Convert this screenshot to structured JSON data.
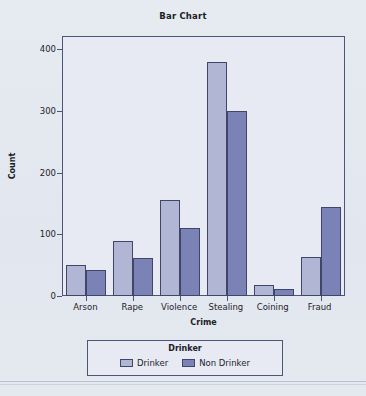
{
  "chart_data": {
    "type": "bar",
    "title": "Bar Chart",
    "xlabel": "Crime",
    "ylabel": "Count",
    "categories": [
      "Arson",
      "Rape",
      "Violence",
      "Stealing",
      "Coining",
      "Fraud"
    ],
    "series": [
      {
        "name": "Drinker",
        "color": "#b0b6d4",
        "values": [
          50,
          90,
          155,
          380,
          18,
          64
        ]
      },
      {
        "name": "Non Drinker",
        "color": "#7a82b6",
        "values": [
          42,
          62,
          110,
          300,
          12,
          145
        ]
      }
    ],
    "ylim": [
      0,
      420
    ],
    "yticks": [
      0,
      100,
      200,
      300,
      400
    ],
    "ytick_labels": [
      "0",
      "100",
      "200",
      "300",
      "400"
    ],
    "grid": false,
    "legend": {
      "title": "Drinker",
      "position": "bottom",
      "entries": [
        "Drinker",
        "Non Drinker"
      ]
    }
  }
}
